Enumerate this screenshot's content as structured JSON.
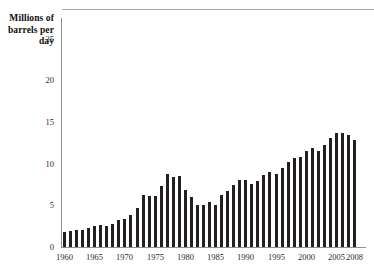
{
  "chart_data": {
    "type": "bar",
    "title": "Millions of barrels per day",
    "xlabel": "",
    "ylabel": "Millions of barrels per day",
    "ylim": [
      0,
      27.5
    ],
    "yticks": [
      0,
      5,
      10,
      15,
      20,
      25
    ],
    "ytick_labels": [
      "0",
      "5",
      "10",
      "15",
      "20",
      "25"
    ],
    "xticks": [
      1960,
      1965,
      1970,
      1975,
      1980,
      1985,
      1990,
      1995,
      2000,
      2005,
      2008
    ],
    "xtick_labels": [
      "1960",
      "1965",
      "1970",
      "1975",
      "1980",
      "1985",
      "1990",
      "1995",
      "2000",
      "2005",
      "2008"
    ],
    "grid": false,
    "legend": null,
    "bar_color": "#231f20",
    "axis_color": "#8e8e8e",
    "categories": [
      1960,
      1961,
      1962,
      1963,
      1964,
      1965,
      1966,
      1967,
      1968,
      1969,
      1970,
      1971,
      1972,
      1973,
      1974,
      1975,
      1976,
      1977,
      1978,
      1979,
      1980,
      1981,
      1982,
      1983,
      1984,
      1985,
      1986,
      1987,
      1988,
      1989,
      1990,
      1991,
      1992,
      1993,
      1994,
      1995,
      1996,
      1997,
      1998,
      1999,
      2000,
      2001,
      2002,
      2003,
      2004,
      2005,
      2006,
      2007,
      2008
    ],
    "values": [
      1.8,
      1.9,
      2.1,
      2.1,
      2.3,
      2.5,
      2.6,
      2.5,
      2.8,
      3.2,
      3.4,
      3.9,
      4.7,
      6.3,
      6.1,
      6.1,
      7.3,
      8.8,
      8.4,
      8.5,
      6.9,
      6.0,
      5.1,
      5.1,
      5.4,
      5.1,
      6.2,
      6.7,
      7.4,
      8.1,
      8.0,
      7.6,
      7.9,
      8.6,
      9.0,
      8.8,
      9.5,
      10.2,
      10.7,
      10.8,
      11.5,
      11.9,
      11.5,
      12.3,
      13.1,
      13.7,
      13.7,
      13.5,
      12.9
    ]
  }
}
